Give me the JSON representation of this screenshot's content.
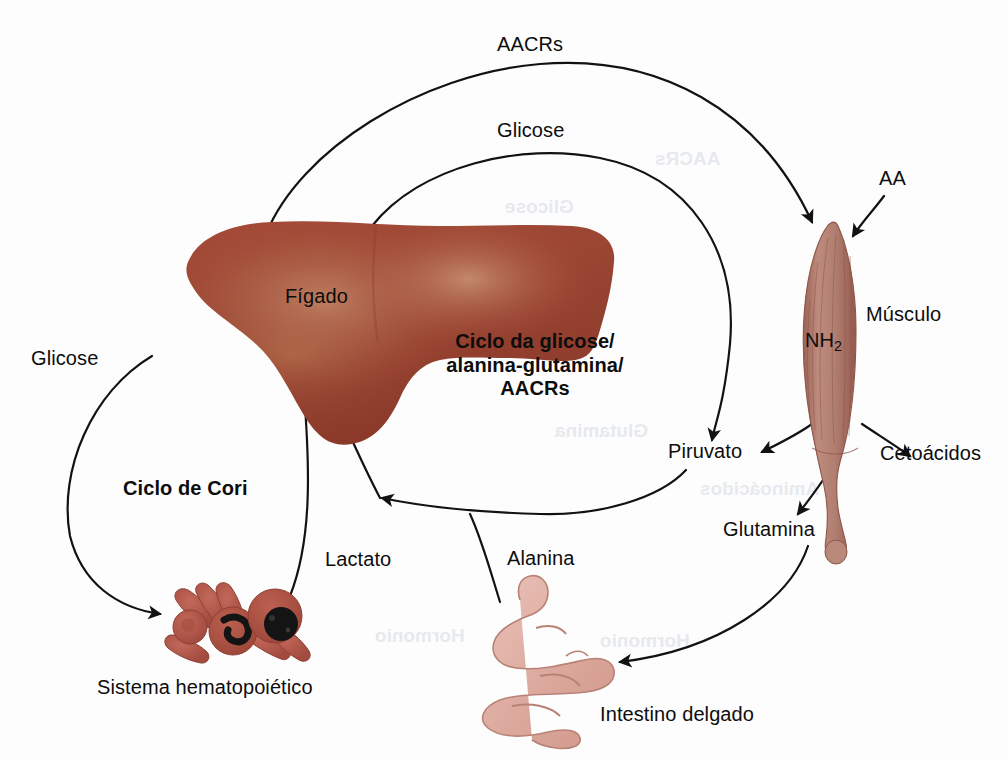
{
  "figure": {
    "kind": "biological-pathway-diagram",
    "language": "pt-BR",
    "center_title_line1": "Ciclo da glicose/",
    "center_title_line2": "alanina-glutamina/",
    "center_title_line3": "AACRs",
    "cori_cycle_label": "Ciclo de Cori"
  },
  "organs": [
    {
      "id": "liver",
      "label": "Fígado",
      "color": "#9d4534"
    },
    {
      "id": "muscle",
      "label": "Músculo",
      "color": "#b27d70",
      "inner_label": "NH",
      "inner_sub": "2"
    },
    {
      "id": "blood",
      "label": "Sistema hematopoiético",
      "color": "#b3564a"
    },
    {
      "id": "intestine",
      "label": "Intestino delgado",
      "color": "#e0afa5"
    }
  ],
  "metabolites": {
    "aacrs_top": "AACRs",
    "glicose_top": "Glicose",
    "glicose_left": "Glicose",
    "aa": "AA",
    "piruvato": "Piruvato",
    "cetoacidos": "Cetoácidos",
    "glutamina": "Glutamina",
    "alanina": "Alanina",
    "lactato": "Lactato",
    "nh2_text": "NH",
    "nh2_subscript": "2"
  },
  "ghost_text": {
    "g1": "Glicose",
    "g2": "Glutamina",
    "g3": "Aminoácidos",
    "g4": "Hormonio",
    "g5": "AACRs"
  },
  "colors": {
    "background": "#fdfdfd",
    "stroke": "#121212",
    "text": "#0d0d0d",
    "liver_dark": "#8e3b2c",
    "liver_mid": "#a64d3a",
    "liver_light": "#c08a6a",
    "muscle_dark": "#9c6356",
    "muscle_mid": "#b98a7c",
    "muscle_line": "#8d5547",
    "blood_cell": "#b3564a",
    "blood_nucleus": "#161616",
    "intestine_fill": "#e2b2a8",
    "intestine_line": "#b98277"
  }
}
